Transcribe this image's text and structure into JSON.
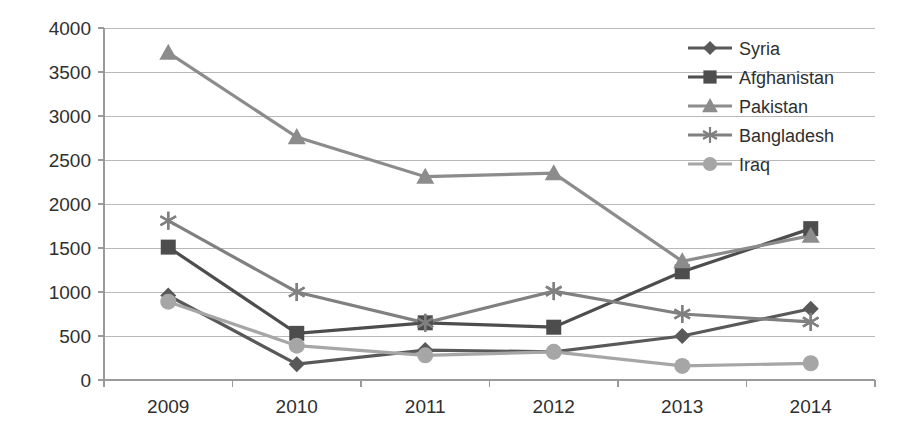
{
  "chart_data": {
    "type": "line",
    "title": "",
    "xlabel": "",
    "ylabel": "",
    "categories": [
      "2009",
      "2010",
      "2011",
      "2012",
      "2013",
      "2014"
    ],
    "ylim": [
      0,
      4000
    ],
    "ytick_step": 500,
    "ytick_labels": [
      "0",
      "500",
      "1000",
      "1500",
      "2000",
      "2500",
      "3000",
      "3500",
      "4000"
    ],
    "grid": true,
    "legend_position": "top-right",
    "series": [
      {
        "name": "Syria",
        "marker": "diamond",
        "color": "#595959",
        "values": [
          960,
          180,
          340,
          320,
          500,
          810
        ]
      },
      {
        "name": "Afghanistan",
        "marker": "square",
        "color": "#4d4d4d",
        "values": [
          1510,
          530,
          650,
          600,
          1230,
          1720
        ]
      },
      {
        "name": "Pakistan",
        "marker": "triangle",
        "color": "#8c8c8c",
        "values": [
          3720,
          2760,
          2310,
          2350,
          1350,
          1640
        ]
      },
      {
        "name": "Bangladesh",
        "marker": "asterisk",
        "color": "#808080",
        "values": [
          1810,
          1000,
          650,
          1010,
          750,
          660
        ]
      },
      {
        "name": "Iraq",
        "marker": "circle",
        "color": "#a6a6a6",
        "values": [
          890,
          390,
          280,
          320,
          160,
          190
        ]
      }
    ]
  },
  "colors": {
    "gridline": "#b8b8b8",
    "axis": "#9a9a9a",
    "text": "#2f2f2f",
    "background": "#ffffff"
  }
}
